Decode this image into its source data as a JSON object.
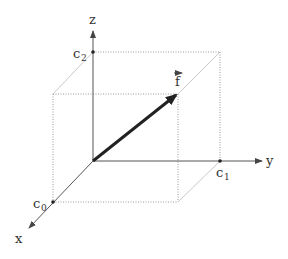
{
  "diagram": {
    "type": "3d-coordinate-system",
    "axes": {
      "x": {
        "label": "x"
      },
      "y": {
        "label": "y"
      },
      "z": {
        "label": "z"
      }
    },
    "points": {
      "c0": {
        "base": "c",
        "sub": "0",
        "axis": "x"
      },
      "c1": {
        "base": "c",
        "sub": "1",
        "axis": "y"
      },
      "c2": {
        "base": "c",
        "sub": "2",
        "axis": "z"
      }
    },
    "vector": {
      "label": "f",
      "has_arrow_accent": true
    },
    "colors": {
      "axis": "#555555",
      "vector": "#222222",
      "box_edges": "#999999"
    }
  }
}
